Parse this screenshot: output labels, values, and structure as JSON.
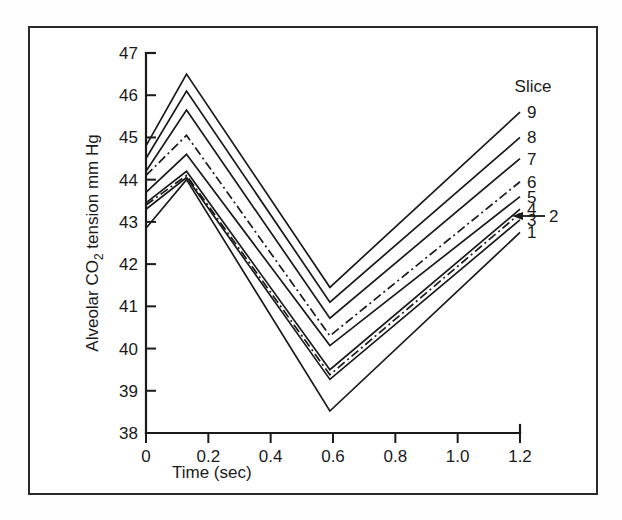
{
  "figure": {
    "border_color": "#2b2b2b",
    "background": "#ffffff",
    "line_color": "#1a1a1a"
  },
  "chart_data": {
    "type": "line",
    "title": "",
    "xlabel": "Time (sec)",
    "ylabel_parts": {
      "before": "Alveolar CO",
      "subscript": "2",
      "after": " tension mm Hg"
    },
    "ylabel": "Alveolar CO2 tension mm Hg",
    "x": [
      0,
      0.13,
      0.59,
      1.2
    ],
    "xlim": [
      0,
      1.2
    ],
    "ylim": [
      38,
      47
    ],
    "xticks": [
      0,
      0.2,
      0.4,
      0.6,
      0.8,
      1.0,
      1.2
    ],
    "xticklabels": [
      "0",
      "0.2",
      "0.4",
      "0.6",
      "0.8",
      "1.0",
      "1.2"
    ],
    "yticks": [
      38,
      39,
      40,
      41,
      42,
      43,
      44,
      45,
      46,
      47
    ],
    "yticklabels": [
      "38",
      "39",
      "40",
      "41",
      "42",
      "43",
      "44",
      "45",
      "46",
      "47"
    ],
    "grid": false,
    "legend_title": "Slice",
    "legend_position": "right",
    "series": [
      {
        "name": "9",
        "label": "9",
        "style": "solid",
        "values": [
          44.8,
          46.5,
          41.45,
          45.6
        ]
      },
      {
        "name": "8",
        "label": "8",
        "style": "solid",
        "values": [
          44.5,
          46.1,
          41.1,
          45.0
        ]
      },
      {
        "name": "7",
        "label": "7",
        "style": "solid",
        "values": [
          44.2,
          45.65,
          40.72,
          44.5
        ]
      },
      {
        "name": "6",
        "label": "6",
        "style": "dashdot",
        "values": [
          44.1,
          45.05,
          40.3,
          43.95
        ]
      },
      {
        "name": "5",
        "label": "5",
        "style": "solid",
        "values": [
          43.7,
          44.6,
          40.07,
          43.6
        ]
      },
      {
        "name": "4",
        "label": "4",
        "style": "solid",
        "values": [
          43.45,
          44.2,
          39.5,
          43.3
        ]
      },
      {
        "name": "2",
        "label": "2",
        "style": "dashdot",
        "values": [
          43.4,
          44.1,
          39.38,
          43.2
        ]
      },
      {
        "name": "3",
        "label": "3",
        "style": "solid",
        "values": [
          43.3,
          44.05,
          39.27,
          43.05
        ]
      },
      {
        "name": "1",
        "label": "1",
        "style": "solid",
        "values": [
          42.85,
          44.0,
          38.52,
          42.75
        ]
      }
    ],
    "annotation": {
      "text": "2",
      "target_series": "2",
      "arrow": "left"
    }
  }
}
